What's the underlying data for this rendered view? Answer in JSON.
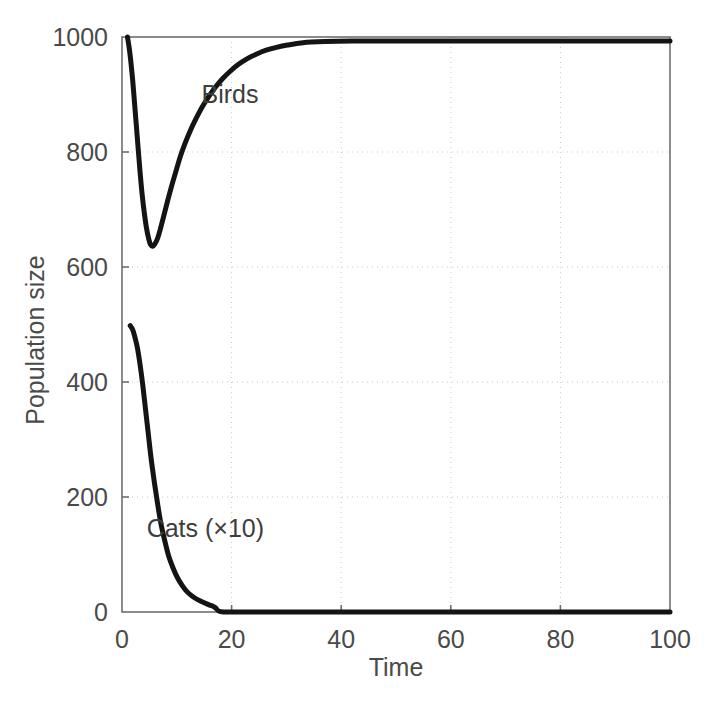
{
  "figure": {
    "background": "#ffffff",
    "axis_color": "#6e6e6e",
    "grid_color": "#c9c9c9",
    "curve_color": "#141414"
  },
  "chart_data": {
    "type": "line",
    "title": "",
    "xlabel": "Time",
    "ylabel": "Population size",
    "xlim": [
      0,
      100
    ],
    "ylim": [
      0,
      1000
    ],
    "xticks": [
      0,
      20,
      40,
      60,
      80,
      100
    ],
    "yticks": [
      0,
      200,
      400,
      600,
      800,
      1000
    ],
    "xtick_labels": [
      "0",
      "20",
      "40",
      "60",
      "80",
      "100"
    ],
    "ytick_labels": [
      "0",
      "200",
      "400",
      "600",
      "800",
      "1000"
    ],
    "grid": true,
    "grid_style": "dotted",
    "legend": "inline-annotations",
    "annotations": [
      {
        "text": "Birds",
        "x": 14.5,
        "y": 885
      },
      {
        "text": "Cats (×10)",
        "x": 4.5,
        "y": 130
      }
    ],
    "series": [
      {
        "name": "Birds",
        "color": "#141414",
        "x": [
          1,
          1.4,
          1.9,
          2.4,
          2.9,
          3.3,
          3.7,
          4.1,
          4.5,
          4.9,
          5.2,
          5.6,
          6.0,
          6.5,
          7.0,
          7.6,
          8.3,
          9.0,
          9.8,
          10.6,
          11.5,
          12.5,
          13.5,
          14.6,
          15.8,
          17.0,
          18.3,
          19.7,
          21.2,
          22.8,
          24.5,
          26.3,
          28.2,
          30.2,
          33,
          37,
          42,
          48,
          55,
          63,
          72,
          82,
          92,
          100
        ],
        "y": [
          1000,
          975,
          930,
          872,
          812,
          765,
          724,
          692,
          666,
          648,
          639,
          636,
          640,
          650,
          666,
          688,
          714,
          739,
          765,
          791,
          815,
          838,
          858,
          878,
          896,
          912,
          927,
          940,
          952,
          962,
          970,
          977,
          982,
          986,
          990,
          992,
          993,
          993,
          993,
          993,
          993,
          993,
          993,
          993
        ]
      },
      {
        "name": "Cats (×10)",
        "color": "#141414",
        "x": [
          1.5,
          1.9,
          2.3,
          2.8,
          3.3,
          3.8,
          4.3,
          4.8,
          5.3,
          5.9,
          6.5,
          7.1,
          7.8,
          8.5,
          9.3,
          10.1,
          11.0,
          11.9,
          12.9,
          13.9,
          15.0,
          16.0,
          16.6,
          17.1,
          17.6,
          18.5,
          20,
          25,
          32,
          40,
          50,
          60,
          70,
          80,
          90,
          100
        ],
        "y": [
          498,
          492,
          480,
          460,
          430,
          394,
          352,
          310,
          268,
          226,
          188,
          154,
          124,
          98,
          77,
          60,
          46,
          35,
          27,
          21,
          16,
          12,
          10,
          7,
          2,
          0,
          0,
          0,
          0,
          0,
          0,
          0,
          0,
          0,
          0,
          0
        ]
      }
    ],
    "notes": [
      "Birds population crashes from 1000 to a minimum of about 635 near t=5, then recovers asymptotically to about 1000.",
      "Cats population (shown multiplied by 10) starts near 500 and decays monotonically to 0 by about t=17.5."
    ]
  },
  "caption": {
    "text": ""
  }
}
